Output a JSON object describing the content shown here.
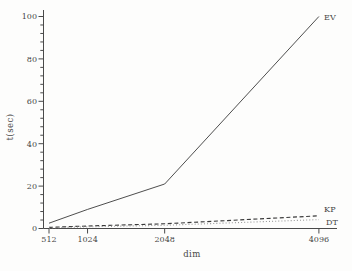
{
  "chart_data": {
    "type": "line",
    "title": "",
    "xlabel": "dim",
    "ylabel": "t(sec)",
    "x": [
      512,
      1024,
      2048,
      4096
    ],
    "x_tick_labels": [
      "512",
      "1024",
      "2048",
      "4096"
    ],
    "xlim": [
      440,
      4340
    ],
    "ylim": [
      0,
      103
    ],
    "y_major_ticks": [
      0,
      20,
      40,
      60,
      80,
      100
    ],
    "y_minor_step": 4,
    "grid": false,
    "legend_position": "line-end-labels",
    "axis_color": "#4a4a4a",
    "series": [
      {
        "name": "EV",
        "style": "solid",
        "color": "#3a3a3a",
        "values": [
          2.5,
          9,
          21,
          100
        ]
      },
      {
        "name": "KP",
        "style": "dashed",
        "color": "#3a3a3a",
        "values": [
          0.5,
          1.2,
          2.2,
          6
        ]
      },
      {
        "name": "DT",
        "style": "dotted",
        "color": "#979797",
        "values": [
          0.3,
          0.8,
          1.5,
          4.2
        ]
      }
    ]
  }
}
